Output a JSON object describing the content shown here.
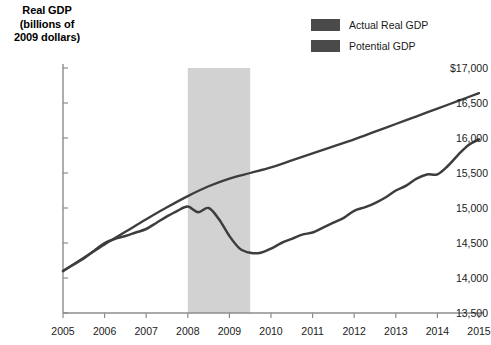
{
  "chart_data": {
    "type": "line",
    "title": "",
    "ylabel_lines": [
      "Real GDP",
      "(billions of",
      "2009 dollars)"
    ],
    "ylabel": "Real GDP (billions of 2009 dollars)",
    "xlabel": "",
    "ylim": [
      13500,
      17000
    ],
    "xlim": [
      2005,
      2015
    ],
    "yticks": [
      17000,
      16500,
      16000,
      15500,
      15000,
      14500,
      14000,
      13500
    ],
    "ytick_labels": [
      "$17,000",
      "16,500",
      "16,000",
      "15,500",
      "15,000",
      "14,500",
      "14,000",
      "13,500"
    ],
    "xticks": [
      2005,
      2006,
      2007,
      2008,
      2009,
      2010,
      2011,
      2012,
      2013,
      2014,
      2015
    ],
    "xtick_labels": [
      "2005",
      "2006",
      "2007",
      "2008",
      "2009",
      "2010",
      "2011",
      "2012",
      "2013",
      "2014",
      "2015"
    ],
    "grid": false,
    "legend_position": "top-right",
    "line_color": "#3d3d3d",
    "shading_color": "#d2d2d2",
    "axis_color": "#8c8c8c",
    "annotations": [
      {
        "name": "recession-band",
        "label": "",
        "x_start": 2008.0,
        "x_end": 2009.5
      }
    ],
    "series": [
      {
        "name": "Actual Real GDP",
        "color": "#3d3d3d",
        "x": [
          2005.0,
          2005.25,
          2005.5,
          2005.75,
          2006.0,
          2006.25,
          2006.5,
          2006.75,
          2007.0,
          2007.25,
          2007.5,
          2007.75,
          2008.0,
          2008.25,
          2008.5,
          2008.75,
          2009.0,
          2009.25,
          2009.5,
          2009.75,
          2010.0,
          2010.25,
          2010.5,
          2010.75,
          2011.0,
          2011.25,
          2011.5,
          2011.75,
          2012.0,
          2012.25,
          2012.5,
          2012.75,
          2013.0,
          2013.25,
          2013.5,
          2013.75,
          2014.0,
          2014.25,
          2014.5,
          2014.75,
          2015.0
        ],
        "y": [
          14100,
          14190,
          14280,
          14390,
          14500,
          14560,
          14600,
          14650,
          14700,
          14790,
          14880,
          14960,
          15020,
          14940,
          15000,
          14840,
          14600,
          14420,
          14360,
          14360,
          14420,
          14500,
          14560,
          14620,
          14650,
          14720,
          14790,
          14860,
          14960,
          15010,
          15070,
          15150,
          15250,
          15320,
          15420,
          15480,
          15480,
          15600,
          15760,
          15900,
          15980
        ],
        "y_end_label": 16200
      },
      {
        "name": "Potential GDP",
        "color": "#3d3d3d",
        "x": [
          2005.0,
          2005.5,
          2006.0,
          2006.5,
          2007.0,
          2007.5,
          2008.0,
          2008.5,
          2009.0,
          2009.5,
          2010.0,
          2010.5,
          2011.0,
          2011.5,
          2012.0,
          2012.5,
          2013.0,
          2013.5,
          2014.0,
          2014.5,
          2015.0
        ],
        "y": [
          14100,
          14290,
          14480,
          14660,
          14840,
          15010,
          15170,
          15310,
          15420,
          15500,
          15580,
          15680,
          15780,
          15880,
          15980,
          16090,
          16200,
          16310,
          16420,
          16530,
          16640
        ]
      }
    ]
  },
  "legend": {
    "items": [
      {
        "label": "Actual Real GDP",
        "color": "#4a4a4a"
      },
      {
        "label": "Potential GDP",
        "color": "#4a4a4a"
      }
    ]
  }
}
